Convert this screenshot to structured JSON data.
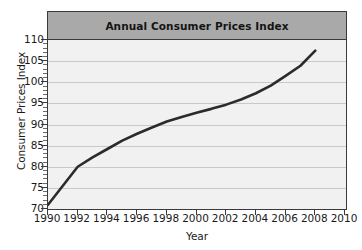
{
  "chart_data": {
    "type": "line",
    "title": "Annual Consumer Prices Index",
    "xlabel": "Year",
    "ylabel": "Consumer Prices Index",
    "x": [
      1990,
      1991,
      1992,
      1993,
      1994,
      1995,
      1996,
      1997,
      1998,
      1999,
      2000,
      2001,
      2002,
      2003,
      2004,
      2005,
      2006,
      2007,
      2008
    ],
    "values": [
      71.0,
      75.5,
      80.0,
      82.2,
      84.2,
      86.2,
      87.8,
      89.3,
      90.7,
      91.8,
      92.8,
      93.7,
      94.7,
      95.9,
      97.4,
      99.2,
      101.5,
      103.9,
      107.5
    ],
    "series": [
      {
        "name": "Annual Consumer Prices Index",
        "values": [
          71.0,
          75.5,
          80.0,
          82.2,
          84.2,
          86.2,
          87.8,
          89.3,
          90.7,
          91.8,
          92.8,
          93.7,
          94.7,
          95.9,
          97.4,
          99.2,
          101.5,
          103.9,
          107.5
        ]
      }
    ],
    "xlim": [
      1990,
      2010
    ],
    "ylim": [
      70,
      110
    ],
    "x_ticks": [
      1990,
      1992,
      1994,
      1996,
      1998,
      2000,
      2002,
      2004,
      2006,
      2008,
      2010
    ],
    "y_ticks": [
      70,
      75,
      80,
      85,
      90,
      95,
      100,
      105,
      110
    ],
    "x_tick_labels": [
      "1990",
      "1992",
      "1994",
      "1996",
      "1998",
      "2000",
      "2002",
      "2004",
      "2006",
      "2008",
      "2010"
    ],
    "y_tick_labels": [
      "70",
      "75",
      "80",
      "85",
      "90",
      "95",
      "100",
      "105",
      "110"
    ],
    "grid": true,
    "legend": false,
    "legend_position": "none",
    "line_color": "#2b2b2b",
    "plot_background": "#f1f1f1",
    "title_band_color": "#a9a9a9",
    "grid_color": "#c9c9c9",
    "axis_color": "#3a3a3a"
  }
}
